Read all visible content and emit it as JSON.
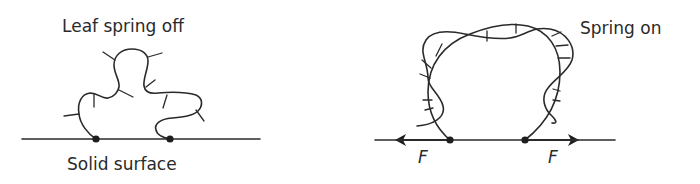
{
  "figure": {
    "left_panel": {
      "title": "Leaf spring off",
      "surface_label": "Solid surface",
      "anchor_points": 2
    },
    "right_panel": {
      "title": "Spring on",
      "force_labels": [
        "F",
        "F"
      ],
      "force_directions": [
        "left",
        "right"
      ],
      "anchor_points": 2
    },
    "colors": {
      "stroke": "#2a2a2a",
      "background": "#ffffff"
    }
  }
}
